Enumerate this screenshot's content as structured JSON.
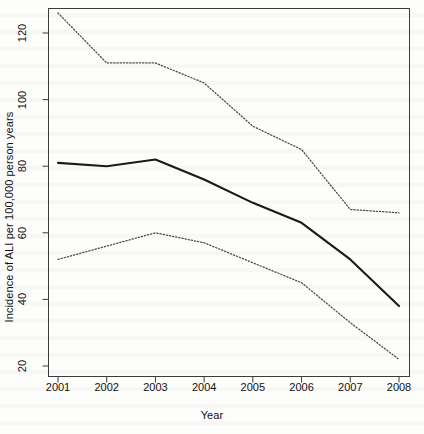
{
  "figure": {
    "background_color": "#fdfdfc",
    "ink_color": "#1a1a1a"
  },
  "axis": {
    "x_title": "Year",
    "y_title": "Incidence of ALI per 100,000 person years",
    "x_ticks": [
      "2001",
      "2002",
      "2003",
      "2004",
      "2005",
      "2006",
      "2007",
      "2008"
    ],
    "y_ticks": [
      "20",
      "40",
      "60",
      "80",
      "100",
      "120"
    ]
  },
  "chart_data": {
    "type": "line",
    "title": "",
    "xlabel": "Year",
    "ylabel": "Incidence of ALI per 100,000 person years",
    "x": [
      2001,
      2002,
      2003,
      2004,
      2005,
      2006,
      2007,
      2008
    ],
    "categories": [
      "2001",
      "2002",
      "2003",
      "2004",
      "2005",
      "2006",
      "2007",
      "2008"
    ],
    "xlim": [
      2001,
      2008
    ],
    "ylim": [
      18,
      128
    ],
    "grid": false,
    "legend": "none",
    "series": [
      {
        "name": "Upper 95% confidence limit",
        "style": "dotted",
        "color": "#4a4a4a",
        "values": [
          126,
          111,
          111,
          105,
          92,
          85,
          67,
          66
        ]
      },
      {
        "name": "Incidence of ALI",
        "style": "solid",
        "color": "#1a1a1a",
        "values": [
          81,
          80,
          82,
          76,
          69,
          63,
          52,
          38
        ]
      },
      {
        "name": "Lower 95% confidence limit",
        "style": "dotted",
        "color": "#4a4a4a",
        "values": [
          52,
          56,
          60,
          57,
          51,
          45,
          33,
          22
        ]
      }
    ]
  }
}
